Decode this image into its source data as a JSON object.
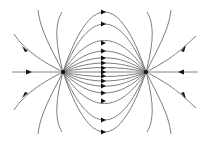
{
  "diagram": {
    "type": "electric-field-lines",
    "charges": [
      {
        "id": "left-charge",
        "x": 63,
        "y": 72
      },
      {
        "id": "right-charge",
        "x": 146,
        "y": 72
      }
    ],
    "arrow_direction_between_charges": "left-to-right",
    "colors": {
      "line": "#6e6e6e",
      "arrow": "#111111",
      "background": "#ffffff"
    }
  }
}
